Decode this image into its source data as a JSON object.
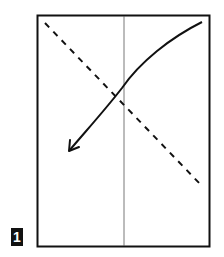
{
  "step": {
    "number": "1"
  },
  "diagram": {
    "paper": {
      "x": 37,
      "y": 15,
      "width": 173,
      "height": 232
    },
    "crease_line": {
      "type": "vertical-center",
      "x": 124
    },
    "fold_line": {
      "type": "valley-fold-dashed",
      "from": [
        45,
        23
      ],
      "to": [
        202,
        186
      ]
    },
    "fold_arrow": {
      "from": [
        202,
        22
      ],
      "to": [
        68,
        152
      ],
      "direction": "top-right corner folds down-left"
    }
  },
  "colors": {
    "line": "#111111",
    "crease": "#555555",
    "background": "#ffffff",
    "badge_bg": "#111111",
    "badge_text": "#ffffff"
  }
}
